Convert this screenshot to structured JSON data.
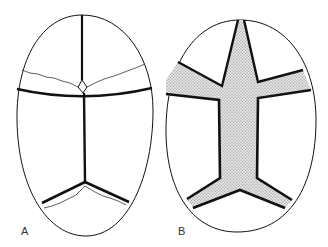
{
  "figure": {
    "panels": [
      {
        "label": "A",
        "description": "Skull outline (top view) with thin sutures and fine wavy lines"
      },
      {
        "label": "B",
        "description": "Skull outline (top view) with widened stippled suture regions"
      }
    ],
    "colors": {
      "line": "#111111",
      "stipple": "#c8c8c8",
      "background": "#ffffff"
    }
  }
}
